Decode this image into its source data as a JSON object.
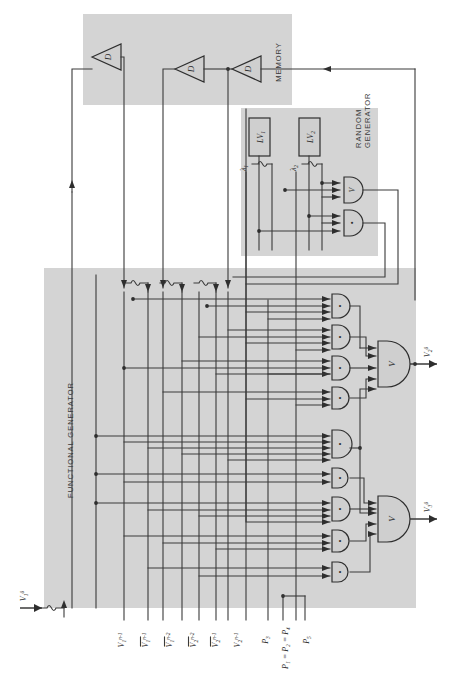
{
  "figure": {
    "kind": "logic-circuit-block-diagram",
    "orientation": "rotated-90-ccw",
    "width": 461,
    "height": 682,
    "background": "#ffffff",
    "block_fill": "#d4d4d4",
    "line_color": "#3a3a3a"
  },
  "blocks": [
    {
      "id": "memory",
      "label": "MEMORY"
    },
    {
      "id": "random_generator",
      "label_line1": "RANDOM",
      "label_line2": "GENERATOR"
    },
    {
      "id": "functional_generator",
      "label": "FUNCTIONAL GENERATOR"
    }
  ],
  "memory": {
    "label": "MEMORY",
    "delay_elements": [
      {
        "id": "d1",
        "label": "D"
      },
      {
        "id": "d2",
        "label": "D"
      },
      {
        "id": "d3",
        "label": "D"
      }
    ]
  },
  "random_generator": {
    "label_line1": "RANDOM",
    "label_line2": "GENERATOR",
    "sources": [
      {
        "id": "lv1",
        "label": "LV",
        "subscript": "1"
      },
      {
        "id": "lv2",
        "label": "LV",
        "subscript": "2"
      }
    ],
    "signals": [
      {
        "id": "lambda1",
        "label": "λ",
        "subscript": "1"
      },
      {
        "id": "lambda2",
        "label": "λ",
        "subscript": "2"
      }
    ],
    "gates": [
      {
        "id": "rg-or",
        "type": "OR",
        "glyph": "V",
        "inputs": 3
      },
      {
        "id": "rg-and",
        "type": "AND",
        "glyph": "•",
        "inputs": 3
      }
    ]
  },
  "functional_generator": {
    "label": "FUNCTIONAL GENERATOR",
    "inverters": [
      {
        "id": "inv1",
        "glyph": "not"
      },
      {
        "id": "inv2",
        "glyph": "not"
      },
      {
        "id": "inv3",
        "glyph": "not"
      },
      {
        "id": "inv4",
        "glyph": "not"
      }
    ],
    "and_gates": [
      {
        "id": "a1",
        "type": "AND",
        "glyph": "•",
        "inputs": 4
      },
      {
        "id": "a2",
        "type": "AND",
        "glyph": "•",
        "inputs": 4
      },
      {
        "id": "a3",
        "type": "AND",
        "glyph": "•",
        "inputs": 4
      },
      {
        "id": "a4",
        "type": "AND",
        "glyph": "•",
        "inputs": 3
      },
      {
        "id": "a5",
        "type": "AND",
        "glyph": "•",
        "inputs": 5
      },
      {
        "id": "a6",
        "type": "AND",
        "glyph": "•",
        "inputs": 2
      },
      {
        "id": "a7",
        "type": "AND",
        "glyph": "•",
        "inputs": 4
      },
      {
        "id": "a8",
        "type": "AND",
        "glyph": "•",
        "inputs": 3
      },
      {
        "id": "a9",
        "type": "AND",
        "glyph": "•",
        "inputs": 2
      }
    ],
    "or_gates": [
      {
        "id": "or_top",
        "type": "OR",
        "glyph": "V",
        "inputs": 5
      },
      {
        "id": "or_bottom",
        "type": "OR",
        "glyph": "V",
        "inputs": 5
      }
    ]
  },
  "signal_labels": {
    "input": {
      "base": "V",
      "sub": "1",
      "sup": "0"
    },
    "outputs": [
      {
        "id": "out2",
        "base": "V",
        "sub": "2",
        "sup": "0"
      },
      {
        "id": "out3",
        "base": "V",
        "sub": "3",
        "sup": "0"
      }
    ],
    "state_inputs": [
      {
        "id": "s1",
        "base": "V",
        "sub": "1",
        "sup": "n-1",
        "overbar": false
      },
      {
        "id": "s2",
        "base": "V",
        "sub": "1",
        "sup": "n-1",
        "overbar": true
      },
      {
        "id": "s3",
        "base": "V",
        "sub": "1",
        "sup": "n-2",
        "overbar": true
      },
      {
        "id": "s4",
        "base": "V",
        "sub": "2",
        "sup": "n-2",
        "overbar": true
      },
      {
        "id": "s5",
        "base": "V",
        "sub": "2",
        "sup": "n-1",
        "overbar": true
      },
      {
        "id": "s6",
        "base": "V",
        "sub": "2",
        "sup": "n-1",
        "overbar": false
      }
    ],
    "probabilities": [
      {
        "id": "p3",
        "text": "P",
        "sub": "3"
      },
      {
        "id": "p124",
        "text": "P₁ = P₂ = P₄"
      },
      {
        "id": "p5",
        "text": "P",
        "sub": "5"
      }
    ]
  }
}
